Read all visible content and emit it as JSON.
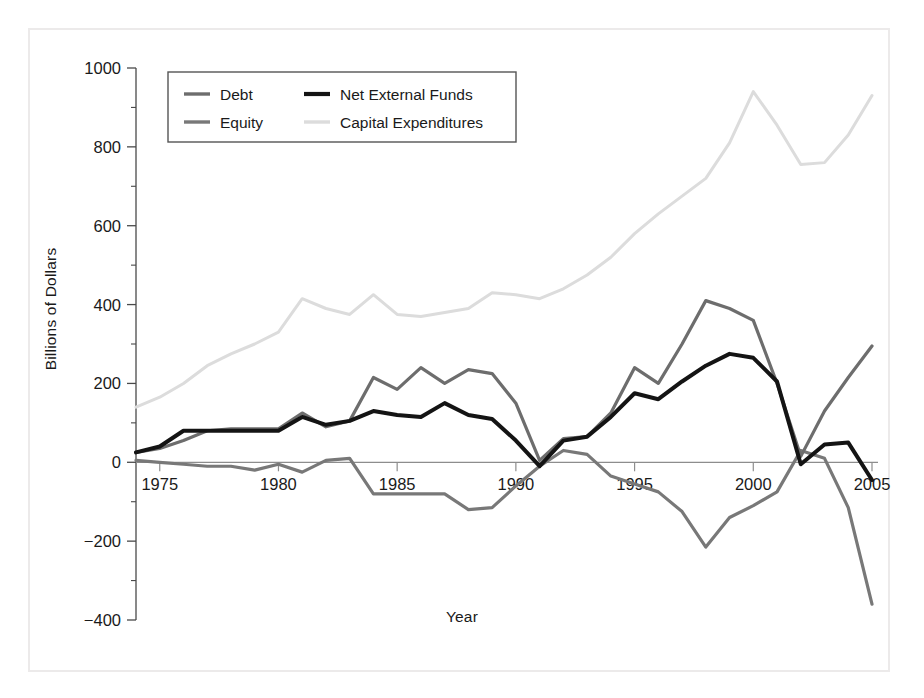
{
  "chart_data": {
    "type": "line",
    "title": "",
    "xlabel": "Year",
    "ylabel": "Billions of Dollars",
    "xlim": [
      1974,
      2005
    ],
    "ylim": [
      -400,
      1000
    ],
    "xticks": [
      1975,
      1980,
      1985,
      1990,
      1995,
      2000,
      2005
    ],
    "xtick_labels": [
      "1975",
      "1980",
      "1985",
      "1990",
      "1995",
      "2000",
      "2005"
    ],
    "yticks": [
      -400,
      -200,
      0,
      200,
      400,
      600,
      800,
      1000
    ],
    "ytick_labels": [
      "−400",
      "−200",
      "0",
      "200",
      "400",
      "600",
      "800",
      "1000"
    ],
    "minor_ytick_step": 100,
    "grid": false,
    "legend_position": "upper-left-inside",
    "zero_line": true,
    "x": [
      1974,
      1975,
      1976,
      1977,
      1978,
      1979,
      1980,
      1981,
      1982,
      1983,
      1984,
      1985,
      1986,
      1987,
      1988,
      1989,
      1990,
      1991,
      1992,
      1993,
      1994,
      1995,
      1996,
      1997,
      1998,
      1999,
      2000,
      2001,
      2002,
      2003,
      2004,
      2005
    ],
    "series": [
      {
        "name": "Debt",
        "color": "#6d6d6d",
        "width": 3.2,
        "values": [
          25,
          35,
          55,
          80,
          85,
          85,
          85,
          125,
          90,
          105,
          215,
          185,
          240,
          200,
          235,
          225,
          150,
          5,
          60,
          65,
          125,
          240,
          200,
          300,
          410,
          390,
          360,
          200,
          15,
          130,
          215,
          295
        ]
      },
      {
        "name": "Equity",
        "color": "#787878",
        "width": 3.2,
        "values": [
          5,
          0,
          -5,
          -10,
          -10,
          -20,
          -5,
          -25,
          5,
          10,
          -80,
          -80,
          -80,
          -80,
          -120,
          -115,
          -60,
          -10,
          30,
          20,
          -35,
          -55,
          -75,
          -125,
          -215,
          -140,
          -110,
          -75,
          30,
          10,
          -115,
          -360
        ]
      },
      {
        "name": "Net External Funds",
        "color": "#141414",
        "width": 4.0,
        "values": [
          25,
          40,
          80,
          80,
          80,
          80,
          80,
          115,
          95,
          105,
          130,
          120,
          115,
          150,
          120,
          110,
          55,
          -10,
          55,
          65,
          115,
          175,
          160,
          205,
          245,
          275,
          265,
          205,
          -5,
          45,
          50,
          -45
        ]
      },
      {
        "name": "Capital Expenditures",
        "color": "#dcdcdc",
        "width": 3.0,
        "values": [
          140,
          165,
          200,
          245,
          275,
          300,
          330,
          415,
          390,
          375,
          425,
          375,
          370,
          380,
          390,
          430,
          425,
          415,
          440,
          475,
          520,
          580,
          630,
          675,
          720,
          810,
          940,
          855,
          755,
          760,
          830,
          930
        ]
      }
    ]
  },
  "legend": {
    "entries": [
      {
        "label": "Debt",
        "color": "#6d6d6d"
      },
      {
        "label": "Net External Funds",
        "color": "#141414"
      },
      {
        "label": "Equity",
        "color": "#787878"
      },
      {
        "label": "Capital Expenditures",
        "color": "#dcdcdc"
      }
    ]
  },
  "axes": {
    "y_title": "Billions of Dollars",
    "x_title": "Year"
  }
}
